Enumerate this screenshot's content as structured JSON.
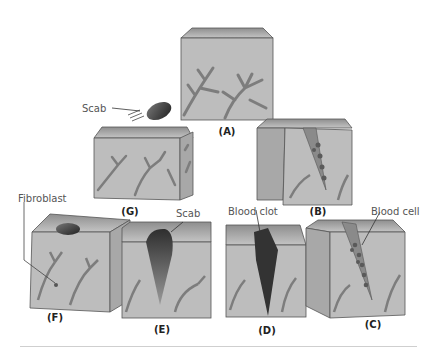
{
  "diagram": {
    "panels": [
      {
        "id": "A",
        "label": "(A)",
        "description": "Intact skin block with blood vessels"
      },
      {
        "id": "B",
        "label": "(B)",
        "description": "Wound cut with blood cells entering"
      },
      {
        "id": "C",
        "label": "(C)",
        "description": "Blood cells fill the wound"
      },
      {
        "id": "D",
        "label": "(D)",
        "description": "Blood clot forms"
      },
      {
        "id": "E",
        "label": "(E)",
        "description": "Clot becomes scab"
      },
      {
        "id": "F",
        "label": "(F)",
        "description": "Fibroblasts repair tissue beneath scab"
      },
      {
        "id": "G",
        "label": "(G)",
        "description": "Scab falls off, healed skin"
      }
    ],
    "annotations": {
      "scab_g": "Scab",
      "scab_e": "Scab",
      "blood_clot": "Blood clot",
      "blood_cell": "Blood cell",
      "fibroblast": "Fibroblast"
    },
    "colors": {
      "tissue_front": "#b9b9b9",
      "tissue_top": "#9a9a9a",
      "tissue_side": "#a6a6a6",
      "vessel": "#7d7d7d",
      "clot": "#3a3a3a",
      "outline": "#555555"
    }
  }
}
